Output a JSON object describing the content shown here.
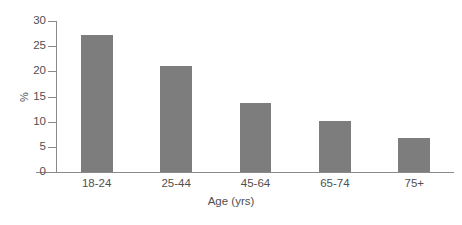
{
  "chart_data": {
    "type": "bar",
    "title": "",
    "subtitle": "",
    "categories": [
      "18-24",
      "25-44",
      "45-64",
      "65-74",
      "75+"
    ],
    "values": [
      27.2,
      21.1,
      13.8,
      10.1,
      6.7
    ],
    "xlabel": "Age (yrs)",
    "ylabel": "%",
    "ylim": [
      0,
      30
    ],
    "ytick_labels": [
      "0",
      "5",
      "10",
      "15",
      "20",
      "25",
      "30"
    ],
    "ytick_values": [
      0,
      5,
      10,
      15,
      20,
      25,
      30
    ],
    "grid": false,
    "legend": null,
    "bar_color": "#7d7d7d",
    "axis_color": "#8a8a8a",
    "text_color": "#4f4f4f",
    "background_color": "#ffffff"
  }
}
